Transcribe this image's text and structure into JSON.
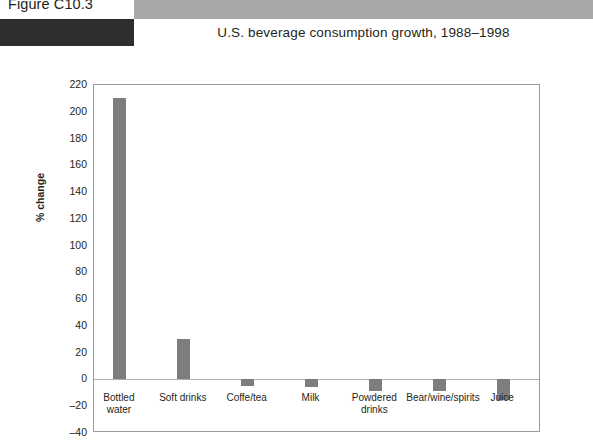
{
  "header": {
    "figure_number": "Figure C10.3",
    "title": "U.S. beverage consumption growth, 1988–1998",
    "band_color": "#a8a8a8",
    "tab_color": "#2e2e2e"
  },
  "chart_data": {
    "type": "bar",
    "title": "U.S. beverage consumption growth, 1988–1998",
    "xlabel": "",
    "ylabel": "% change",
    "categories": [
      "Bottled\nwater",
      "Soft drinks",
      "Coffe/tea",
      "Milk",
      "Powdered\ndrinks",
      "Bear/wine/spirits",
      "Juice"
    ],
    "values": [
      210,
      30,
      -5,
      -6,
      -9,
      -9,
      -15
    ],
    "ylim": [
      -40,
      220
    ],
    "yticks": [
      220,
      200,
      180,
      160,
      140,
      120,
      100,
      80,
      60,
      40,
      20,
      0,
      -20,
      -40
    ],
    "ytick_labels": [
      "220",
      "200",
      "180",
      "160",
      "140",
      "120",
      "100",
      "80",
      "60",
      "40",
      "20",
      "0",
      "–20",
      "–40"
    ],
    "grid": false,
    "legend": false,
    "bar_color": "#7d7d7d",
    "zero_line": 0
  }
}
